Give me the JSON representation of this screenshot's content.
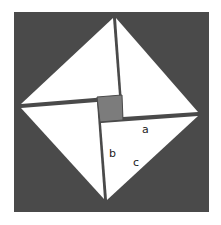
{
  "diagram": {
    "colors": {
      "background": "#ffffff",
      "outer_square": "#4a4a4a",
      "triangles": "#ffffff",
      "inner_square": "#7c7c7c",
      "lines": "#4a4a4a"
    },
    "outer_square": {
      "x": 14,
      "y": 12,
      "width": 195,
      "height": 200
    },
    "vertices": {
      "top": [
        113,
        18
      ],
      "right": [
        198,
        114
      ],
      "bottom": [
        107,
        200
      ],
      "left": [
        21,
        107
      ]
    },
    "inner_square": {
      "points": [
        [
          97,
          97
        ],
        [
          122,
          95
        ],
        [
          123,
          120
        ],
        [
          100,
          122
        ]
      ]
    },
    "triangles": [
      {
        "name": "top-left",
        "points": [
          [
            113,
            18
          ],
          [
            119,
            96
          ],
          [
            21,
            104
          ]
        ]
      },
      {
        "name": "top-right",
        "points": [
          [
            116,
            18
          ],
          [
            198,
            112
          ],
          [
            123,
            117
          ]
        ]
      },
      {
        "name": "bottom-right",
        "points": [
          [
            198,
            116
          ],
          [
            107,
            200
          ],
          [
            101,
            123
          ]
        ]
      },
      {
        "name": "bottom-left",
        "points": [
          [
            21,
            108
          ],
          [
            97,
            102
          ],
          [
            104,
            199
          ]
        ]
      }
    ],
    "labels": [
      {
        "text": "a",
        "x": 142,
        "y": 133
      },
      {
        "text": "b",
        "x": 109,
        "y": 157
      },
      {
        "text": "c",
        "x": 133,
        "y": 166
      }
    ]
  }
}
